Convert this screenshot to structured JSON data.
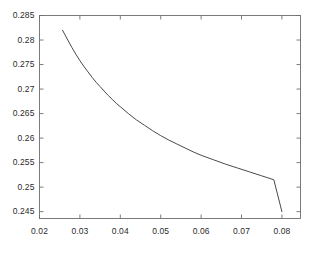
{
  "chart_data": {
    "type": "line",
    "title": "",
    "subtitle": "",
    "xlabel": "",
    "ylabel": "",
    "xlim": [
      0.02,
      0.0846
    ],
    "ylim": [
      0.2436,
      0.285
    ],
    "xticks": [
      0.02,
      0.03,
      0.04,
      0.05,
      0.06,
      0.07,
      0.08
    ],
    "yticks": [
      0.245,
      0.25,
      0.255,
      0.26,
      0.265,
      0.27,
      0.275,
      0.28,
      0.285
    ],
    "xtick_labels": [
      "0.02",
      "0.03",
      "0.04",
      "0.05",
      "0.06",
      "0.07",
      "0.08"
    ],
    "ytick_labels": [
      "0.245",
      "0.25",
      "0.255",
      "0.26",
      "0.265",
      "0.27",
      "0.275",
      "0.28",
      "0.285"
    ],
    "grid": false,
    "legend": null,
    "legend_position": "none",
    "line_color": "#4a4a4a",
    "line_width": 1,
    "axis_color": "#6e6e6e",
    "background": "#ffffff",
    "series": [
      {
        "name": "curve",
        "x": [
          0.0257,
          0.027,
          0.028,
          0.029,
          0.03,
          0.031,
          0.032,
          0.033,
          0.034,
          0.035,
          0.036,
          0.037,
          0.038,
          0.039,
          0.04,
          0.042,
          0.044,
          0.046,
          0.048,
          0.05,
          0.052,
          0.054,
          0.056,
          0.058,
          0.06,
          0.063,
          0.066,
          0.069,
          0.072,
          0.075,
          0.078,
          0.08
        ],
        "y": [
          0.282,
          0.28,
          0.2785,
          0.2771,
          0.2758,
          0.2746,
          0.2735,
          0.2724,
          0.2714,
          0.2705,
          0.2696,
          0.2687,
          0.2679,
          0.2671,
          0.2664,
          0.265,
          0.2637,
          0.2626,
          0.2615,
          0.2605,
          0.2596,
          0.2588,
          0.258,
          0.2572,
          0.2565,
          0.2556,
          0.2547,
          0.2539,
          0.2531,
          0.2523,
          0.2515,
          0.245
        ]
      }
    ],
    "data_points_at_ticks": {
      "0.03": 0.2758,
      "0.04": 0.2664,
      "0.05": 0.2605,
      "0.06": 0.2565,
      "0.07": 0.2534,
      "0.08": 0.245
    }
  }
}
